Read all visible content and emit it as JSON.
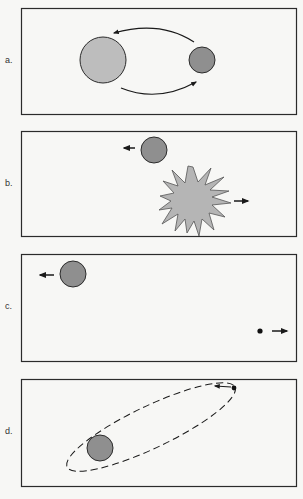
{
  "figure": {
    "colors": {
      "background": "#f7f7f5",
      "frame": "#2b2b2b",
      "large_star": "#bdbdbd",
      "small_star": "#8f8f8f",
      "explosion": "#b5b5b5",
      "dot": "#111111"
    },
    "panels": [
      {
        "label": "a.",
        "content": "Two stars orbiting each other, curved arrows showing orbital motion"
      },
      {
        "label": "b.",
        "content": "Star moving left; larger star exploding as a supernova moving right"
      },
      {
        "label": "c.",
        "content": "Star moving left; small remnant dot moving right"
      },
      {
        "label": "d.",
        "content": "Small remnant in dashed elliptical orbit around star"
      }
    ]
  }
}
